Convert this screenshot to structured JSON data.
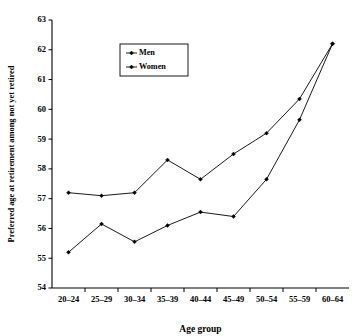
{
  "chart_data": {
    "type": "line",
    "title": "",
    "xlabel": "Age group",
    "ylabel": "Preferred age at retirement among not yet retired",
    "categories": [
      "20–24",
      "25–29",
      "30–34",
      "35–39",
      "40–44",
      "45–49",
      "50–54",
      "55–59",
      "60–64"
    ],
    "ylim": [
      54,
      63
    ],
    "yticks": [
      54,
      55,
      56,
      57,
      58,
      59,
      60,
      61,
      62,
      63
    ],
    "ytick_labels": [
      "54",
      "55",
      "56",
      "57",
      "58",
      "59",
      "60",
      "61",
      "62",
      "63"
    ],
    "grid": false,
    "legend_position": "upper-left-inside",
    "series": [
      {
        "name": "Men",
        "marker": "diamond",
        "color": "#000000",
        "values": [
          57.2,
          57.1,
          57.2,
          58.3,
          57.65,
          58.5,
          59.2,
          60.35,
          62.2
        ]
      },
      {
        "name": "Women",
        "marker": "diamond",
        "color": "#000000",
        "values": [
          55.2,
          56.15,
          55.55,
          56.1,
          56.55,
          56.4,
          57.65,
          59.65,
          62.2
        ]
      }
    ]
  },
  "figure": {
    "background_color": "#ffffff",
    "axis_color": "#000000"
  }
}
